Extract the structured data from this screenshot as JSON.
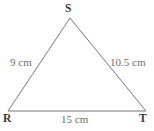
{
  "figure": {
    "kind": "geometry-diagram",
    "shape": "triangle",
    "name": "Triangle RST",
    "canvas": {
      "width": 154,
      "height": 131,
      "background": "#ffffff"
    },
    "stroke": {
      "color": "#777777",
      "width": 1
    },
    "text_color": "#70706f",
    "vertex_text_color": "#3a3a3a",
    "vertices": [
      {
        "id": "S",
        "label": "S",
        "x": 70,
        "y": 18,
        "position": "apex"
      },
      {
        "id": "R",
        "label": "R",
        "x": 8,
        "y": 111,
        "position": "bottom-left"
      },
      {
        "id": "T",
        "label": "T",
        "x": 146,
        "y": 111,
        "position": "bottom-right"
      }
    ],
    "sides": [
      {
        "id": "RS",
        "from": "R",
        "to": "S",
        "label": "9 cm",
        "value": 9,
        "unit": "cm",
        "side": "left"
      },
      {
        "id": "ST",
        "from": "S",
        "to": "T",
        "label": "10.5 cm",
        "value": 10.5,
        "unit": "cm",
        "side": "right"
      },
      {
        "id": "RT",
        "from": "R",
        "to": "T",
        "label": "15 cm",
        "value": 15,
        "unit": "cm",
        "side": "bottom"
      }
    ]
  }
}
